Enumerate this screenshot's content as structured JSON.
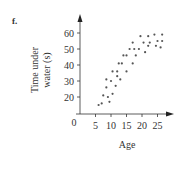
{
  "figure_label": "f.",
  "chart_data": {
    "type": "scatter",
    "title": "",
    "xlabel": "Age",
    "ylabel": "Time under water (s)",
    "ylabel_lines": [
      "Time under",
      "water (s)"
    ],
    "x_ticks": [
      5,
      10,
      15,
      20,
      25
    ],
    "y_ticks": [
      20,
      30,
      40,
      50,
      60
    ],
    "origin_label": "0",
    "xlim": [
      0,
      27
    ],
    "ylim": [
      0,
      65
    ],
    "y_axis_break": true,
    "grid": false,
    "legend": null,
    "marker_color": "#555555",
    "points": [
      {
        "x": 6,
        "y": 15
      },
      {
        "x": 7,
        "y": 16
      },
      {
        "x": 7.5,
        "y": 21
      },
      {
        "x": 9,
        "y": 20
      },
      {
        "x": 8.5,
        "y": 26
      },
      {
        "x": 9.5,
        "y": 17
      },
      {
        "x": 10.5,
        "y": 22
      },
      {
        "x": 8.5,
        "y": 31
      },
      {
        "x": 10,
        "y": 30
      },
      {
        "x": 10.5,
        "y": 36
      },
      {
        "x": 11.5,
        "y": 27
      },
      {
        "x": 12,
        "y": 36
      },
      {
        "x": 12,
        "y": 33
      },
      {
        "x": 13,
        "y": 31
      },
      {
        "x": 12.5,
        "y": 41
      },
      {
        "x": 13.5,
        "y": 41
      },
      {
        "x": 14,
        "y": 46
      },
      {
        "x": 15,
        "y": 36
      },
      {
        "x": 15,
        "y": 46
      },
      {
        "x": 16,
        "y": 50
      },
      {
        "x": 17,
        "y": 41
      },
      {
        "x": 17,
        "y": 54
      },
      {
        "x": 17.5,
        "y": 50
      },
      {
        "x": 18,
        "y": 46
      },
      {
        "x": 19,
        "y": 50
      },
      {
        "x": 19.5,
        "y": 58
      },
      {
        "x": 20.5,
        "y": 54
      },
      {
        "x": 21,
        "y": 48
      },
      {
        "x": 22,
        "y": 58
      },
      {
        "x": 22,
        "y": 52
      },
      {
        "x": 22.5,
        "y": 54
      },
      {
        "x": 24,
        "y": 59
      },
      {
        "x": 24.5,
        "y": 52
      },
      {
        "x": 25,
        "y": 55
      },
      {
        "x": 26.5,
        "y": 59
      },
      {
        "x": 26.5,
        "y": 55
      },
      {
        "x": 26,
        "y": 51
      }
    ]
  }
}
